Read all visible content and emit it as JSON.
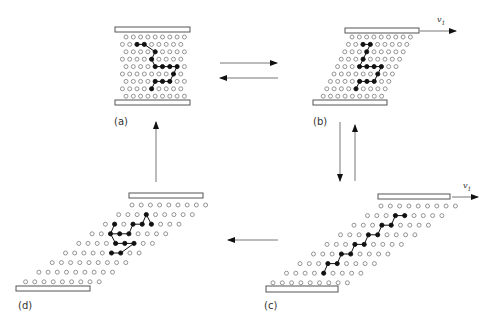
{
  "figure": {
    "colors": {
      "stroke": "#555555",
      "filled": "#111111",
      "open": "#888888",
      "plate_fill": "#ffffff"
    },
    "panels": [
      {
        "id": "a",
        "label": "(a)",
        "label_pos": [
          114,
          116
        ],
        "top_plate": [
          115,
          27,
          75,
          5
        ],
        "bottom_plate": [
          115,
          100,
          75,
          5
        ],
        "rows": 9,
        "cols": 9,
        "row0_y": 37,
        "row_dy": 7.4,
        "row0_x": 126,
        "col_dx": 7.3,
        "shear": 0,
        "odd_offset": -3.6,
        "filled": [
          [
            1,
            2
          ],
          [
            1,
            3
          ],
          [
            2,
            4
          ],
          [
            3,
            4
          ],
          [
            4,
            4
          ],
          [
            4,
            5
          ],
          [
            4,
            6
          ],
          [
            4,
            7
          ],
          [
            5,
            7
          ],
          [
            6,
            4
          ],
          [
            6,
            5
          ],
          [
            6,
            6
          ],
          [
            7,
            4
          ]
        ],
        "chain": [
          [
            [
              1,
              2
            ],
            [
              1,
              3
            ],
            [
              2,
              4
            ],
            [
              3,
              4
            ],
            [
              4,
              4
            ],
            [
              4,
              5
            ],
            [
              4,
              6
            ],
            [
              4,
              7
            ],
            [
              5,
              7
            ],
            [
              6,
              6
            ],
            [
              6,
              5
            ],
            [
              6,
              4
            ],
            [
              7,
              4
            ]
          ]
        ]
      },
      {
        "id": "b",
        "label": "(b)",
        "label_pos": [
          313,
          116
        ],
        "top_plate": [
          345,
          28,
          74,
          5
        ],
        "bottom_plate": [
          313,
          100,
          74,
          5
        ],
        "rows": 9,
        "cols": 9,
        "row0_y": 37,
        "row_dy": 7.4,
        "row0_x": 352,
        "col_dx": 7.3,
        "shear": -3.6,
        "odd_offset": 0,
        "velocity": {
          "text": "v",
          "sub": "1",
          "arrow": [
            420,
            31,
            456,
            31
          ],
          "text_pos": [
            437,
            15
          ]
        },
        "filled": [
          [
            1,
            2
          ],
          [
            1,
            3
          ],
          [
            2,
            3
          ],
          [
            3,
            3
          ],
          [
            4,
            3
          ],
          [
            4,
            4
          ],
          [
            4,
            5
          ],
          [
            4,
            6
          ],
          [
            5,
            6
          ],
          [
            6,
            4
          ],
          [
            6,
            5
          ],
          [
            6,
            6
          ],
          [
            7,
            4
          ]
        ],
        "chain": [
          [
            [
              1,
              2
            ],
            [
              1,
              3
            ],
            [
              2,
              3
            ],
            [
              3,
              3
            ],
            [
              4,
              3
            ],
            [
              4,
              4
            ],
            [
              4,
              5
            ],
            [
              4,
              6
            ],
            [
              5,
              6
            ],
            [
              6,
              6
            ],
            [
              6,
              5
            ],
            [
              6,
              4
            ],
            [
              7,
              4
            ]
          ]
        ]
      },
      {
        "id": "c",
        "label": "(c)",
        "label_pos": [
          264,
          300
        ],
        "top_plate": [
          378,
          194,
          72,
          5
        ],
        "bottom_plate": [
          266,
          286,
          72,
          6
        ],
        "rows": 9,
        "cols": 9,
        "row0_y": 206,
        "row_dy": 9.6,
        "row0_x": 381,
        "col_dx": 9.3,
        "shear": -13.5,
        "odd_offset": 0,
        "velocity": {
          "text": "v",
          "sub": "1",
          "arrow": [
            452,
            197,
            478,
            197
          ],
          "text_pos": [
            463,
            181
          ]
        },
        "filled": [
          [
            1,
            3
          ],
          [
            1,
            4
          ],
          [
            2,
            3
          ],
          [
            2,
            4
          ],
          [
            3,
            3
          ],
          [
            3,
            4
          ],
          [
            4,
            3
          ],
          [
            4,
            4
          ],
          [
            5,
            3
          ],
          [
            5,
            4
          ],
          [
            6,
            3
          ],
          [
            6,
            4
          ],
          [
            7,
            4
          ]
        ],
        "chain": [
          [
            [
              1,
              4
            ],
            [
              1,
              3
            ],
            [
              2,
              4
            ],
            [
              2,
              3
            ],
            [
              3,
              4
            ],
            [
              3,
              3
            ],
            [
              4,
              4
            ],
            [
              4,
              3
            ],
            [
              5,
              4
            ],
            [
              5,
              3
            ],
            [
              6,
              4
            ],
            [
              6,
              3
            ],
            [
              7,
              4
            ]
          ]
        ]
      },
      {
        "id": "d",
        "label": "(d)",
        "label_pos": [
          18,
          300
        ],
        "top_plate": [
          129,
          193,
          74,
          5
        ],
        "bottom_plate": [
          16,
          286,
          74,
          5
        ],
        "rows": 9,
        "cols": 9,
        "row0_y": 205,
        "row_dy": 9.6,
        "row0_x": 132,
        "col_dx": 9.2,
        "shear": -13.3,
        "odd_offset": 0,
        "filled": [
          [
            1,
            3
          ],
          [
            2,
            1
          ],
          [
            2,
            3
          ],
          [
            2,
            4
          ],
          [
            2,
            5
          ],
          [
            3,
            2
          ],
          [
            3,
            3
          ],
          [
            3,
            4
          ],
          [
            4,
            4
          ],
          [
            4,
            5
          ],
          [
            4,
            6
          ],
          [
            5,
            5
          ],
          [
            5,
            6
          ]
        ],
        "chain": [
          [
            [
              2,
              1
            ],
            [
              3,
              2
            ],
            [
              3,
              3
            ],
            [
              3,
              4
            ],
            [
              2,
              3
            ],
            [
              2,
              4
            ],
            [
              1,
              3
            ],
            [
              2,
              5
            ]
          ],
          [
            [
              3,
              2
            ],
            [
              4,
              4
            ],
            [
              4,
              5
            ],
            [
              4,
              6
            ],
            [
              5,
              6
            ],
            [
              5,
              5
            ]
          ]
        ]
      }
    ],
    "arrows": [
      {
        "name": "a-to-b-arrow",
        "from": [
          220,
          63
        ],
        "to": [
          277,
          63
        ]
      },
      {
        "name": "b-to-a-arrow",
        "from": [
          278,
          78
        ],
        "to": [
          220,
          78
        ]
      },
      {
        "name": "b-to-c-arrow",
        "from": [
          340,
          122
        ],
        "to": [
          340,
          181
        ]
      },
      {
        "name": "c-to-b-arrow",
        "from": [
          355,
          181
        ],
        "to": [
          355,
          125
        ]
      },
      {
        "name": "c-to-d-arrow",
        "from": [
          278,
          240
        ],
        "to": [
          228,
          240
        ]
      },
      {
        "name": "d-to-a-arrow",
        "from": [
          156,
          182
        ],
        "to": [
          156,
          122
        ]
      }
    ]
  }
}
